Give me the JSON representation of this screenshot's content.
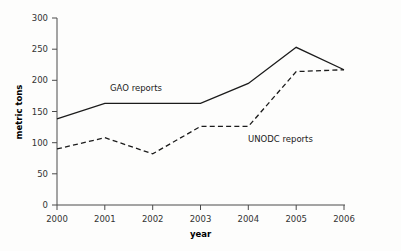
{
  "chart_data": {
    "type": "line",
    "title": "",
    "xlabel": "year",
    "ylabel": "metric tons",
    "categories": [
      "2000",
      "2001",
      "2002",
      "2003",
      "2004",
      "2005",
      "2006"
    ],
    "x": [
      2000,
      2001,
      2002,
      2003,
      2004,
      2005,
      2006
    ],
    "xlim": [
      2000,
      2006
    ],
    "ylim": [
      0,
      300
    ],
    "yticks": [
      0,
      50,
      100,
      150,
      200,
      250,
      300
    ],
    "ytick_labels": [
      "0",
      "50",
      "100",
      "150",
      "200",
      "250",
      "300"
    ],
    "xtick_labels": [
      "2000",
      "2001",
      "2002",
      "2003",
      "2004",
      "2005",
      "2006"
    ],
    "grid": false,
    "legend_position": "inline-annotation",
    "series": [
      {
        "name": "GAO reports",
        "style": "solid",
        "color": "#1b1b1b",
        "values": [
          138,
          163,
          163,
          163,
          195,
          253,
          217
        ]
      },
      {
        "name": "UNODC reports",
        "style": "dashed",
        "color": "#1b1b1b",
        "values": [
          90,
          108,
          82,
          126,
          126,
          214,
          217
        ]
      }
    ],
    "annotations": [
      {
        "text": "GAO reports",
        "x": 2001.1,
        "y": 187
      },
      {
        "text": "UNODC reports",
        "x": 2003.9,
        "y": 110
      }
    ]
  },
  "axes": {
    "y_axis_title": "metric tons",
    "x_axis_title": "year"
  }
}
